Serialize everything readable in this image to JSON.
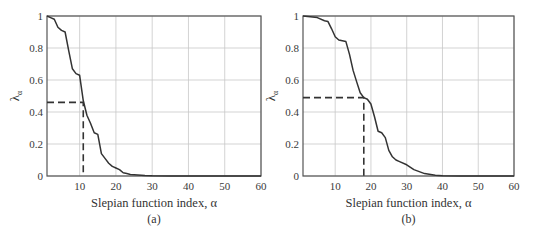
{
  "chart_data": [
    {
      "type": "line",
      "panel": "(a)",
      "title": "",
      "xlabel": "Slepian function index, α",
      "ylabel": "λα",
      "xlim": [
        1,
        60
      ],
      "ylim": [
        0,
        1
      ],
      "xticks": [
        10,
        20,
        30,
        40,
        50,
        60
      ],
      "yticks": [
        0,
        0.2,
        0.4,
        0.6,
        0.8,
        1
      ],
      "ytick_labels": [
        "0",
        "0.2",
        "0.4",
        "0.6",
        "0.8",
        "1"
      ],
      "grid": true,
      "caption": "(a)",
      "series": [
        {
          "name": "eigenvalue",
          "x": [
            1,
            2,
            3,
            4,
            5,
            6,
            7,
            8,
            9,
            10,
            11,
            12,
            13,
            14,
            15,
            16,
            17,
            18,
            19,
            20,
            21,
            22,
            23,
            24,
            25,
            26,
            28,
            30,
            35,
            40,
            50,
            60
          ],
          "values": [
            1.0,
            0.99,
            0.98,
            0.93,
            0.91,
            0.9,
            0.78,
            0.67,
            0.64,
            0.63,
            0.47,
            0.38,
            0.33,
            0.27,
            0.26,
            0.14,
            0.11,
            0.08,
            0.06,
            0.05,
            0.04,
            0.02,
            0.015,
            0.01,
            0.008,
            0.006,
            0.003,
            0.001,
            0.0,
            0.0,
            0.0,
            0.0
          ]
        }
      ],
      "annotations": [
        {
          "type": "dashed-guide",
          "x": 11,
          "y": 0.46
        }
      ]
    },
    {
      "type": "line",
      "panel": "(b)",
      "title": "",
      "xlabel": "Slepian function index, α",
      "ylabel": "λα",
      "xlim": [
        1,
        60
      ],
      "ylim": [
        0,
        1
      ],
      "xticks": [
        10,
        20,
        30,
        40,
        50,
        60
      ],
      "yticks": [
        0,
        0.2,
        0.4,
        0.6,
        0.8,
        1
      ],
      "ytick_labels": [
        "0",
        "0.2",
        "0.4",
        "0.6",
        "0.8",
        "1"
      ],
      "grid": true,
      "caption": "(b)",
      "series": [
        {
          "name": "eigenvalue",
          "x": [
            1,
            3,
            5,
            7,
            8,
            9,
            10,
            11,
            12,
            13,
            14,
            15,
            16,
            17,
            18,
            19,
            20,
            21,
            22,
            23,
            24,
            25,
            26,
            27,
            28,
            30,
            32,
            35,
            38,
            40,
            45,
            50,
            60
          ],
          "values": [
            1.0,
            0.995,
            0.99,
            0.97,
            0.965,
            0.92,
            0.87,
            0.85,
            0.845,
            0.84,
            0.76,
            0.66,
            0.59,
            0.52,
            0.49,
            0.48,
            0.45,
            0.37,
            0.28,
            0.27,
            0.24,
            0.16,
            0.12,
            0.1,
            0.09,
            0.07,
            0.04,
            0.015,
            0.005,
            0.002,
            0.0,
            0.0,
            0.0
          ]
        }
      ],
      "annotations": [
        {
          "type": "dashed-guide",
          "x": 18,
          "y": 0.49
        }
      ]
    }
  ]
}
